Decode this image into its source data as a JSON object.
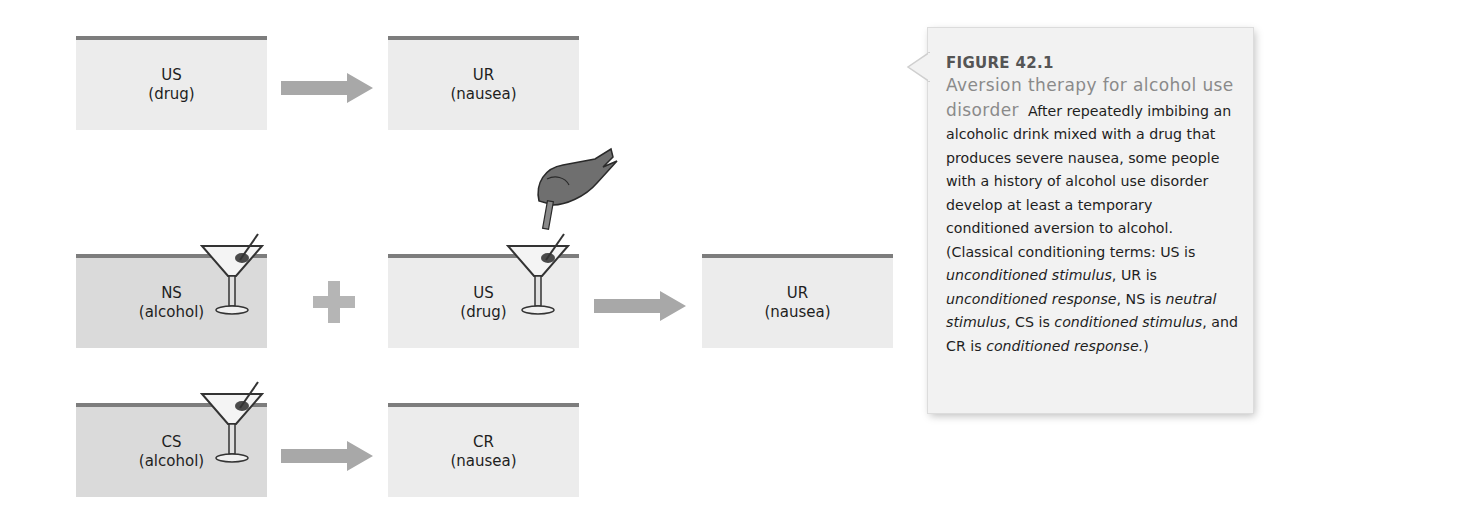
{
  "diagram": {
    "colors": {
      "box_light": "#ececec",
      "box_dark": "#dadada",
      "box_top_border": "#7d7d7d",
      "arrow": "#a8a8a8",
      "caption_bg": "#f2f2f2",
      "caption_title": "#8a8a8a"
    },
    "rows": [
      {
        "name": "before-conditioning",
        "nodes": [
          {
            "term": "US",
            "desc": "(drug)"
          },
          {
            "term": "UR",
            "desc": "(nausea)"
          }
        ],
        "connectors": [
          "arrow"
        ]
      },
      {
        "name": "during-conditioning",
        "nodes": [
          {
            "term": "NS",
            "desc": "(alcohol)",
            "icon": "martini-glass-icon"
          },
          {
            "term": "US",
            "desc": "(drug)",
            "icon": "martini-glass-icon"
          },
          {
            "term": "UR",
            "desc": "(nausea)"
          }
        ],
        "connectors": [
          "plus",
          "arrow"
        ],
        "extra_icons": [
          "hand-with-dropper-icon"
        ]
      },
      {
        "name": "after-conditioning",
        "nodes": [
          {
            "term": "CS",
            "desc": "(alcohol)",
            "icon": "martini-glass-icon"
          },
          {
            "term": "CR",
            "desc": "(nausea)"
          }
        ],
        "connectors": [
          "arrow"
        ]
      }
    ]
  },
  "caption": {
    "figure_number": "FIGURE 42.1",
    "title": "Aversion therapy for alcohol use disorder",
    "body_1": "After repeatedly imbibing an alcoholic drink mixed with a drug that produces severe nausea, some people with a history of alcohol use disorder develop at least a temporary conditioned aversion to alcohol. (Classical conditioning terms: US is ",
    "t_us": "unconditioned stimulus",
    "s1": ", UR is ",
    "t_ur": "unconditioned response",
    "s2": ", NS is ",
    "t_ns": "neutral stimulus",
    "s3": ", CS is ",
    "t_cs": "conditioned stimulus",
    "s4": ", and CR is ",
    "t_cr": "conditioned response.",
    "s5": ")"
  }
}
